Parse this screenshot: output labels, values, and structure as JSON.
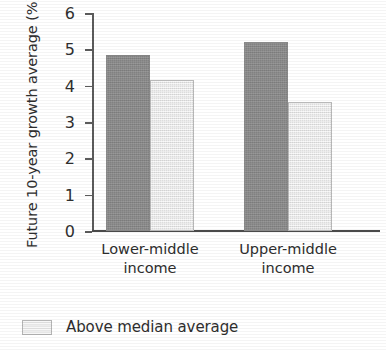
{
  "chart_data": {
    "type": "bar",
    "title": "",
    "subtitle": "",
    "xlabel": "",
    "ylabel": "Future 10-year growth average (%)",
    "categories": [
      "Lower-middle\nincome",
      "Upper-middle\nincome"
    ],
    "ylim": [
      0,
      6
    ],
    "yticks": [
      0,
      1,
      2,
      3,
      4,
      5,
      6
    ],
    "ytick_labels": [
      "0",
      "1",
      "2",
      "3",
      "4",
      "5",
      "6"
    ],
    "grid": false,
    "legend_position": "bottom-left",
    "series": [
      {
        "name": "Below median average",
        "color": "#8e8e8e",
        "values": [
          4.85,
          5.2
        ]
      },
      {
        "name": "Above median average",
        "color": "#ebebeb",
        "values": [
          4.15,
          3.55
        ]
      }
    ],
    "legend": [
      {
        "label": "Above median average",
        "color": "#ebebeb"
      }
    ]
  },
  "axis": {
    "y_title": "Future 10-year growth average (%)"
  }
}
